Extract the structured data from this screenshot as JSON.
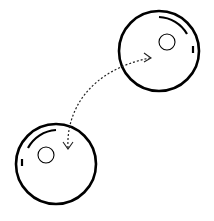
{
  "diagram": {
    "title": "",
    "background": "#ffffff",
    "stroke_color": "#000000",
    "cells": [
      {
        "id": "cell-top-right",
        "cx": 159,
        "cy": 51,
        "r": 40,
        "nucleus": {
          "cx": 167,
          "cy": 42,
          "r": 8
        },
        "highlight_arc": "M159 17 A34 34 0 0 1 187 34",
        "highlight_dash": "M193 46 L193 53"
      },
      {
        "id": "cell-bottom-left",
        "cx": 56,
        "cy": 164,
        "r": 40,
        "nucleus": {
          "cx": 46,
          "cy": 155,
          "r": 8
        },
        "highlight_arc": "M28 148 A34 34 0 0 1 56 130",
        "highlight_dash": "M22 159 L22 166"
      }
    ],
    "connector": {
      "type": "dotted-double-arrow",
      "path": "M68 148 C 66 110, 90 70, 150 58",
      "arrowhead_start": "M63 142 L68 149 L73 142",
      "arrowhead_end": "M144 53 L151 58 L144 62"
    }
  }
}
